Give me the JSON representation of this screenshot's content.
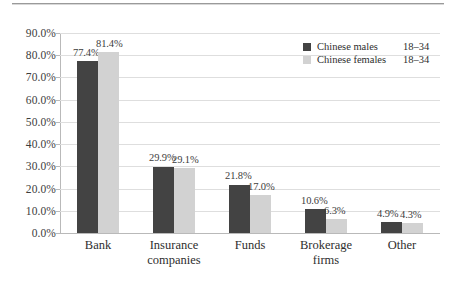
{
  "figure": {
    "background": "#ffffff",
    "rule_color": "#9a9a9a"
  },
  "legend": {
    "position": "top-right",
    "entries": [
      {
        "name": "Chinese males",
        "range": "18–34",
        "color": "#434343",
        "swatch": "legend-swatch-males"
      },
      {
        "name": "Chinese females",
        "range": "18–34",
        "color": "#d2d2d2",
        "swatch": "legend-swatch-females"
      }
    ]
  },
  "chart_data": {
    "type": "bar",
    "title": "",
    "subtitle": "",
    "xlabel": "",
    "ylabel": "",
    "ylim": [
      0,
      90
    ],
    "grid": true,
    "legend_position": "top-right",
    "categories": [
      "Bank",
      "Insurance companies",
      "Funds",
      "Brokerage firms",
      "Other"
    ],
    "category_lines": [
      [
        "Bank"
      ],
      [
        "Insurance",
        "companies"
      ],
      [
        "Funds"
      ],
      [
        "Brokerage",
        "firms"
      ],
      [
        "Other"
      ]
    ],
    "ytick_labels": [
      "90.0%",
      "80.0%",
      "70.0%",
      "60.0%",
      "50.0%",
      "40.0%",
      "30.0%",
      "20.0%",
      "10.0%",
      "0.0%"
    ],
    "ytick_values": [
      90,
      80,
      70,
      60,
      50,
      40,
      30,
      20,
      10,
      0
    ],
    "series": [
      {
        "name": "Chinese males 18–34",
        "color": "#434343",
        "values": [
          77.4,
          29.9,
          21.8,
          10.6,
          4.9
        ],
        "labels": [
          "77.4%",
          "29.9%",
          "21.8%",
          "10.6%",
          "4.9%"
        ]
      },
      {
        "name": "Chinese females 18–34",
        "color": "#d2d2d2",
        "values": [
          81.4,
          29.1,
          17.0,
          6.3,
          4.3
        ],
        "labels": [
          "81.4%",
          "29.1%",
          "17.0%",
          "6.3%",
          "4.3%"
        ]
      }
    ]
  }
}
